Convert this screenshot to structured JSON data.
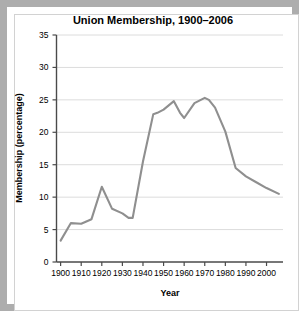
{
  "figure": {
    "border_color": "#adadad",
    "background": "#ffffff",
    "page_background": "#b4b4b4"
  },
  "chart_data": {
    "type": "line",
    "title": "Union Membership, 1900–2006",
    "xlabel": "Year",
    "ylabel": "Membership (percentage)",
    "xlim": [
      1898,
      2008
    ],
    "ylim": [
      0,
      35
    ],
    "xticks": [
      1900,
      1910,
      1920,
      1930,
      1940,
      1950,
      1960,
      1970,
      1980,
      1990,
      2000
    ],
    "xticklabels": [
      "1900",
      "1910",
      "1920",
      "1930",
      "1940",
      "1950",
      "1960",
      "1970",
      "1980",
      "1990",
      "2000"
    ],
    "yticks": [
      0,
      5,
      10,
      15,
      20,
      25,
      30,
      35
    ],
    "yticklabels": [
      "0",
      "5",
      "10",
      "15",
      "20",
      "25",
      "30",
      "35"
    ],
    "grid": "horizontal",
    "grid_color": "#dcdcdc",
    "legend": "none",
    "series": [
      {
        "name": "Union membership",
        "color": "#8f8f8f",
        "x": [
          1900,
          1905,
          1910,
          1915,
          1920,
          1925,
          1930,
          1933,
          1935,
          1940,
          1945,
          1947,
          1950,
          1955,
          1958,
          1960,
          1965,
          1970,
          1972,
          1975,
          1980,
          1985,
          1990,
          1995,
          2000,
          2006
        ],
        "values": [
          3.3,
          6.0,
          5.9,
          6.6,
          11.6,
          8.2,
          7.5,
          6.8,
          6.8,
          15.5,
          22.8,
          23.0,
          23.5,
          24.8,
          23.0,
          22.2,
          24.5,
          25.3,
          25.0,
          23.8,
          20.1,
          14.5,
          13.2,
          12.3,
          11.4,
          10.5
        ]
      }
    ]
  }
}
